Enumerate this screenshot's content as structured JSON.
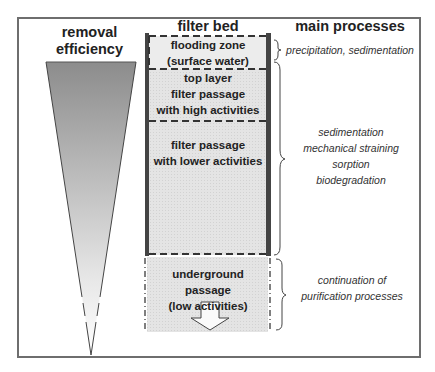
{
  "headers": {
    "left": "removal\nefficiency",
    "left_line1": "removal",
    "left_line2": "efficiency",
    "middle": "filter bed",
    "right": "main processes"
  },
  "zones": [
    {
      "lines": [
        "flooding zone",
        "(surface water)"
      ]
    },
    {
      "lines": [
        "top layer",
        "filter passage",
        "with high activities"
      ]
    },
    {
      "lines": [
        "filter passage",
        "with lower activities"
      ]
    },
    {
      "lines": [
        "underground passage",
        "(low activities)"
      ]
    }
  ],
  "processes": [
    {
      "lines": [
        "precipitation, sedimentation"
      ]
    },
    {
      "lines": [
        "sedimentation",
        "mechanical straining",
        "sorption",
        "biodegradation"
      ]
    },
    {
      "lines": [
        "continuation of",
        "purification processes"
      ]
    }
  ],
  "colors": {
    "frame": "#6e6e6e",
    "wall": "#444444",
    "cone_top": "#8c8c8c",
    "cone_bottom": "#ffffff",
    "zone_fill": "#e6e6e6",
    "flood_fill": "#eeeeee"
  },
  "icons": {
    "flow_arrow": "down-arrow-outline"
  }
}
